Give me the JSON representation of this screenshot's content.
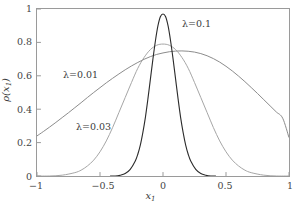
{
  "figure": {
    "background_color": "#ffffff",
    "frame_color": "#9a9a9a"
  },
  "axes": {
    "x_title": "x",
    "x_title_sub": "1",
    "y_title_prefix": "ρ(",
    "y_title_var": "x",
    "y_title_sub": "1",
    "y_title_suffix": ")",
    "x_ticks": [
      "−1",
      "−0.5",
      "0",
      "0.5",
      "1"
    ],
    "y_ticks": [
      "0",
      "0.2",
      "0.4",
      "0.6",
      "0.8",
      "1"
    ]
  },
  "annotations": {
    "lambda_01": "λ=0.1",
    "lambda_001": "λ=0.01",
    "lambda_003": "λ=0.03"
  },
  "chart_data": {
    "type": "line",
    "title": "",
    "xlabel": "x1",
    "ylabel": "rho(x1)",
    "xlim": [
      -1,
      1
    ],
    "ylim": [
      0,
      1
    ],
    "grid": false,
    "legend": "inline-annotations",
    "xticks": [
      -1,
      -0.5,
      0,
      0.5,
      1
    ],
    "yticks": [
      0,
      0.2,
      0.4,
      0.6,
      0.8,
      1
    ],
    "series": [
      {
        "name": "λ=0.01",
        "color": "#8c8c8c",
        "peak_value": 0.77,
        "peak_x": 0,
        "value_at_x_minus1": 0.24,
        "value_at_x_plus1": 0.23,
        "x": [
          -1,
          -0.95,
          -0.9,
          -0.85,
          -0.8,
          -0.75,
          -0.7,
          -0.65,
          -0.6,
          -0.55,
          -0.5,
          -0.45,
          -0.4,
          -0.35,
          -0.3,
          -0.25,
          -0.2,
          -0.15,
          -0.1,
          -0.05,
          0,
          0.05,
          0.1,
          0.15,
          0.2,
          0.25,
          0.3,
          0.35,
          0.4,
          0.45,
          0.5,
          0.55,
          0.6,
          0.65,
          0.7,
          0.75,
          0.8,
          0.85,
          0.9,
          0.95,
          1
        ],
        "values": [
          0.24,
          0.266,
          0.293,
          0.321,
          0.35,
          0.379,
          0.409,
          0.439,
          0.47,
          0.5,
          0.529,
          0.558,
          0.585,
          0.611,
          0.636,
          0.659,
          0.68,
          0.699,
          0.715,
          0.728,
          0.737,
          0.744,
          0.748,
          0.749,
          0.747,
          0.742,
          0.733,
          0.72,
          0.703,
          0.682,
          0.657,
          0.629,
          0.598,
          0.565,
          0.53,
          0.494,
          0.457,
          0.42,
          0.383,
          0.346,
          0.23
        ]
      },
      {
        "name": "λ=0.03",
        "color": "#a6a6a6",
        "peak_value": 0.79,
        "peak_x": 0,
        "half_width_approx": 0.33,
        "x": [
          -1,
          -0.9,
          -0.8,
          -0.7,
          -0.65,
          -0.6,
          -0.55,
          -0.5,
          -0.45,
          -0.4,
          -0.35,
          -0.3,
          -0.25,
          -0.2,
          -0.15,
          -0.1,
          -0.05,
          0,
          0.05,
          0.1,
          0.15,
          0.2,
          0.25,
          0.3,
          0.35,
          0.4,
          0.45,
          0.5,
          0.55,
          0.6,
          0.65,
          0.7,
          0.8,
          0.9,
          1
        ],
        "values": [
          0.0,
          0.0,
          0.005,
          0.02,
          0.035,
          0.06,
          0.095,
          0.145,
          0.21,
          0.29,
          0.38,
          0.47,
          0.56,
          0.645,
          0.71,
          0.757,
          0.783,
          0.79,
          0.783,
          0.757,
          0.71,
          0.645,
          0.56,
          0.47,
          0.38,
          0.29,
          0.21,
          0.145,
          0.095,
          0.06,
          0.035,
          0.02,
          0.005,
          0.0,
          0.0
        ]
      },
      {
        "name": "λ=0.1",
        "color": "#2b2b2b",
        "peak_value": 0.97,
        "peak_x": 0,
        "half_width_approx": 0.13,
        "x": [
          -0.42,
          -0.38,
          -0.34,
          -0.3,
          -0.26,
          -0.22,
          -0.2,
          -0.18,
          -0.16,
          -0.14,
          -0.12,
          -0.1,
          -0.08,
          -0.06,
          -0.04,
          -0.02,
          0,
          0.02,
          0.04,
          0.06,
          0.08,
          0.1,
          0.12,
          0.14,
          0.16,
          0.18,
          0.2,
          0.22,
          0.26,
          0.3,
          0.34,
          0.38,
          0.42
        ],
        "values": [
          0.0,
          0.0,
          0.005,
          0.015,
          0.04,
          0.09,
          0.13,
          0.185,
          0.26,
          0.35,
          0.46,
          0.58,
          0.7,
          0.81,
          0.9,
          0.955,
          0.97,
          0.955,
          0.9,
          0.81,
          0.7,
          0.58,
          0.46,
          0.35,
          0.26,
          0.185,
          0.13,
          0.09,
          0.04,
          0.015,
          0.005,
          0.0,
          0.0
        ]
      }
    ]
  }
}
